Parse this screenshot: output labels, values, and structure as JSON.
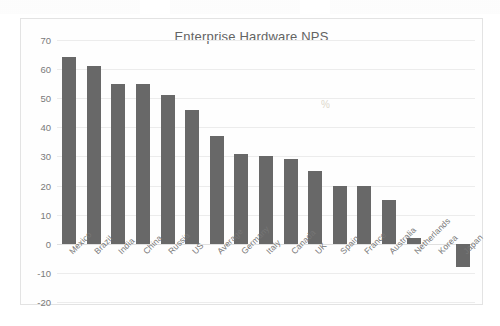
{
  "chart_data": {
    "type": "bar",
    "title": "Enterprise Hardware NPS",
    "xlabel": "",
    "ylabel": "",
    "ylim": [
      -20,
      70
    ],
    "yticks": [
      70,
      60,
      50,
      40,
      30,
      20,
      10,
      0,
      -10,
      -20
    ],
    "grid": true,
    "legend": "none",
    "bar_color": "#686868",
    "categories": [
      "Mexico",
      "Brazil",
      "India",
      "China",
      "Russia",
      "US",
      "Average",
      "Germany",
      "Italy",
      "Canada",
      "UK",
      "Spain",
      "France",
      "Australia",
      "Netherlands",
      "Korea",
      "Japan"
    ],
    "values": [
      64,
      61,
      55,
      55,
      51,
      46,
      37,
      31,
      30,
      29,
      25,
      20,
      20,
      15,
      2,
      0,
      -8
    ]
  }
}
